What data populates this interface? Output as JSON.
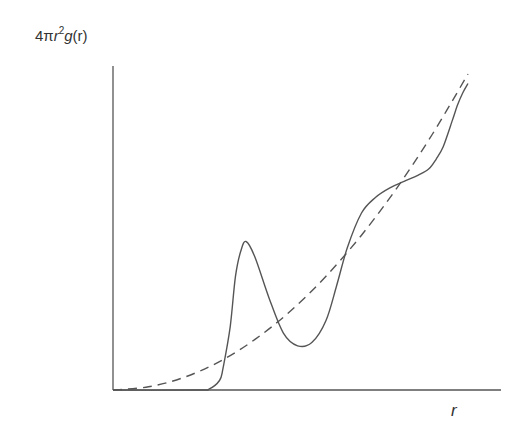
{
  "chart_data": {
    "type": "line",
    "title": "",
    "xlabel": "r",
    "ylabel": "4πr²g(r)",
    "ylabel_parts": {
      "prefix": "4π",
      "var": "r",
      "exp": "2",
      "func": "g",
      "arg": "(r)"
    },
    "xlim": [
      0,
      1
    ],
    "ylim": [
      0,
      1
    ],
    "grid": false,
    "legend": null,
    "ticks": "none",
    "series": [
      {
        "name": "4πr²g(r) (liquid)",
        "style": "solid",
        "color": "#555555",
        "x": [
          0.0,
          0.24,
          0.27,
          0.3,
          0.31,
          0.33,
          0.345,
          0.36,
          0.375,
          0.4,
          0.44,
          0.48,
          0.52,
          0.56,
          0.6,
          0.63,
          0.66,
          0.7,
          0.74,
          0.78,
          0.82,
          0.86,
          0.89,
          0.91,
          0.93,
          0.955,
          0.97,
          0.985,
          1.0
        ],
        "y": [
          0.0,
          0.0,
          0.003,
          0.03,
          0.07,
          0.2,
          0.36,
          0.44,
          0.47,
          0.42,
          0.29,
          0.18,
          0.14,
          0.15,
          0.22,
          0.33,
          0.45,
          0.56,
          0.61,
          0.64,
          0.66,
          0.68,
          0.7,
          0.73,
          0.77,
          0.85,
          0.9,
          0.94,
          0.97
        ]
      },
      {
        "name": "4πr²ρ (uniform density)",
        "style": "dashed",
        "color": "#555555",
        "x": [
          0.0,
          0.1,
          0.2,
          0.3,
          0.4,
          0.5,
          0.6,
          0.7,
          0.8,
          0.9,
          1.0
        ],
        "y": [
          0.0,
          0.01,
          0.04,
          0.09,
          0.16,
          0.25,
          0.36,
          0.49,
          0.64,
          0.81,
          1.0
        ]
      }
    ],
    "axes": {
      "origin_px": [
        113,
        390
      ],
      "x_end_px": 501,
      "y_top_px": 66,
      "data_x_span_px": 355,
      "data_y_span_px": 316
    }
  }
}
